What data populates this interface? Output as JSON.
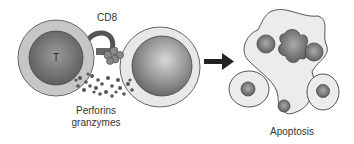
{
  "diagram": {
    "labels": {
      "cd8": "CD8",
      "t_cell": "T",
      "perforins": "Perforins",
      "granzymes": "granzymes",
      "apoptosis": "Apoptosis"
    },
    "colors": {
      "cell_outer": "#c8c8c8",
      "cell_nucleus": "#7a7a7a",
      "target_outer": "#e6e6e6",
      "granule": "#555555",
      "arrow": "#222222"
    }
  }
}
